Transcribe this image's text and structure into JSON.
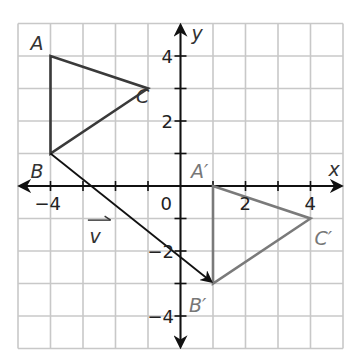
{
  "diagram": {
    "type": "coordinate-plane-translation",
    "axes": {
      "x_label": "x",
      "y_label": "y",
      "range": [
        -5,
        5
      ],
      "tick_labels_x": [
        {
          "value": -4,
          "text": "−4"
        },
        {
          "value": 2,
          "text": "2"
        },
        {
          "value": 4,
          "text": "4"
        }
      ],
      "tick_labels_y": [
        {
          "value": 4,
          "text": "4"
        },
        {
          "value": 2,
          "text": "2"
        },
        {
          "value": -2,
          "text": "−2"
        },
        {
          "value": -4,
          "text": "−4"
        }
      ],
      "origin_label": "0"
    },
    "preimage": {
      "name": "Triangle ABC",
      "color": "#3a3a3a",
      "vertices": [
        {
          "label": "A",
          "x": -4,
          "y": 4
        },
        {
          "label": "B",
          "x": -4,
          "y": 1
        },
        {
          "label": "C",
          "x": -1,
          "y": 3
        }
      ]
    },
    "image": {
      "name": "Triangle A'B'C'",
      "color": "#7a7a7a",
      "vertices": [
        {
          "label": "A′",
          "x": 1,
          "y": 0
        },
        {
          "label": "B′",
          "x": 1,
          "y": -3
        },
        {
          "label": "C′",
          "x": 4,
          "y": -1
        }
      ]
    },
    "vector": {
      "label": "v",
      "from": {
        "x": -4,
        "y": 1
      },
      "to": {
        "x": 1,
        "y": -3
      }
    },
    "grid_color": "#c8c8c8"
  }
}
